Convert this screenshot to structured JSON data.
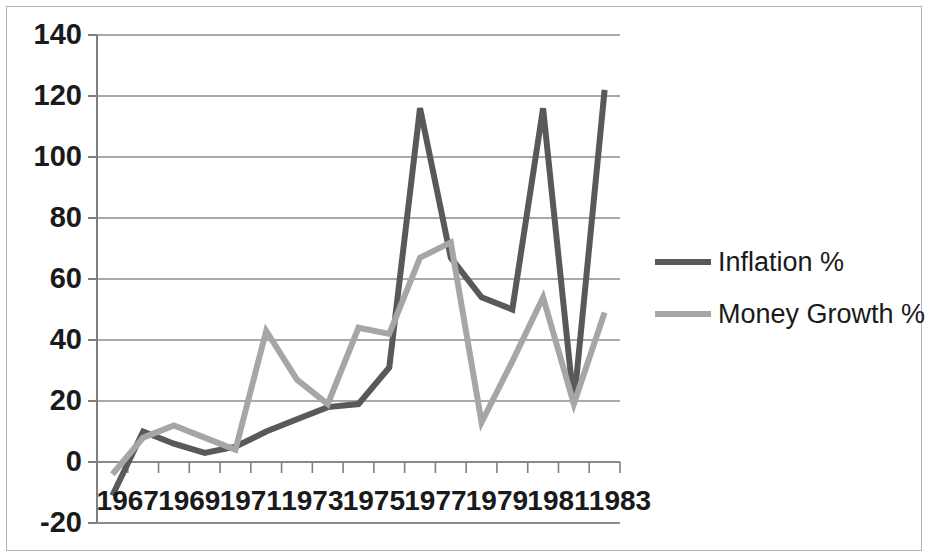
{
  "chart_data": {
    "type": "line",
    "title": "",
    "xlabel": "",
    "ylabel": "",
    "x": [
      1967,
      1968,
      1969,
      1970,
      1971,
      1972,
      1973,
      1974,
      1975,
      1976,
      1977,
      1978,
      1979,
      1980,
      1981,
      1982,
      1983
    ],
    "xlim": [
      1966.5,
      1983.5
    ],
    "ylim": [
      -20,
      140
    ],
    "y_ticks": [
      -20,
      0,
      20,
      40,
      60,
      80,
      100,
      120,
      140
    ],
    "y_tick_labels": [
      "-20",
      "0",
      "20",
      "40",
      "60",
      "80",
      "100",
      "120",
      "140"
    ],
    "x_tick_labels": [
      "1967",
      "1969",
      "1971",
      "1973",
      "1975",
      "1977",
      "1979",
      "1981",
      "1983"
    ],
    "x_tick_label_values": [
      1967,
      1969,
      1971,
      1973,
      1975,
      1977,
      1979,
      1981,
      1983
    ],
    "grid": true,
    "grid_axis": "y",
    "legend_position": "right",
    "series": [
      {
        "name": "Inflation %",
        "color": "#595959",
        "values": [
          -11,
          10,
          6,
          3,
          5,
          10,
          14,
          18,
          19,
          31,
          116,
          67,
          54,
          50,
          116,
          19,
          122
        ]
      },
      {
        "name": "Money Growth %",
        "color": "#a6a6a6",
        "values": [
          -4,
          8,
          12,
          8,
          4,
          43,
          27,
          19,
          44,
          42,
          67,
          72,
          13,
          33,
          54,
          19,
          49
        ]
      }
    ]
  },
  "legend": {
    "entries": [
      {
        "label": "Inflation %",
        "color": "#595959"
      },
      {
        "label": "Money Growth %",
        "color": "#a6a6a6"
      }
    ]
  },
  "axes": {
    "y_labels": [
      "140",
      "120",
      "100",
      "80",
      "60",
      "40",
      "20",
      "0",
      "-20"
    ],
    "x_labels": [
      "1967",
      "1969",
      "1971",
      "1973",
      "1975",
      "1977",
      "1979",
      "1981",
      "1983"
    ]
  },
  "style": {
    "background": "#ffffff",
    "frame_color": "#b3b3b3",
    "grid_color": "#8c8c8c",
    "axis_color": "#7f7f7f",
    "text_color": "#1a1a1a"
  }
}
